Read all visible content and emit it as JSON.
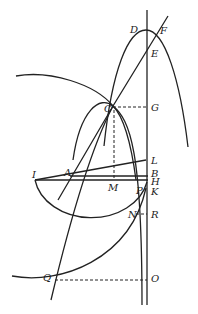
{
  "diagram": {
    "stroke_color": "#222222",
    "points": [
      {
        "id": "D",
        "label": "D",
        "x": 130,
        "y": 33
      },
      {
        "id": "F",
        "label": "F",
        "x": 160,
        "y": 34
      },
      {
        "id": "E",
        "label": "E",
        "x": 151,
        "y": 57
      },
      {
        "id": "C",
        "label": "C",
        "x": 104,
        "y": 112
      },
      {
        "id": "G",
        "label": "G",
        "x": 151,
        "y": 111
      },
      {
        "id": "L",
        "label": "L",
        "x": 151,
        "y": 164
      },
      {
        "id": "I",
        "label": "I",
        "x": 32,
        "y": 178
      },
      {
        "id": "A",
        "label": "A",
        "x": 64,
        "y": 176
      },
      {
        "id": "B",
        "label": "B",
        "x": 151,
        "y": 177
      },
      {
        "id": "H",
        "label": "H",
        "x": 151,
        "y": 185
      },
      {
        "id": "M",
        "label": "M",
        "x": 108,
        "y": 191
      },
      {
        "id": "P",
        "label": "P",
        "x": 136,
        "y": 194
      },
      {
        "id": "K",
        "label": "K",
        "x": 151,
        "y": 195
      },
      {
        "id": "N",
        "label": "N",
        "x": 128,
        "y": 218
      },
      {
        "id": "R",
        "label": "R",
        "x": 151,
        "y": 218
      },
      {
        "id": "Q",
        "label": "Q",
        "x": 43,
        "y": 281
      },
      {
        "id": "O",
        "label": "O",
        "x": 151,
        "y": 282
      }
    ]
  }
}
